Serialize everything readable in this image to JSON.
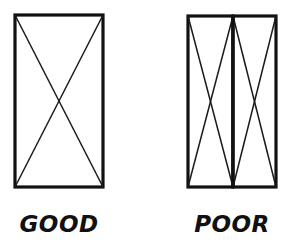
{
  "diagram": {
    "type": "technical-illustration",
    "background_color": "#ffffff",
    "line_color": "#111111",
    "figures": [
      {
        "id": "good",
        "caption": "GOOD",
        "caption_x": 59,
        "caption_y": 232,
        "description": "single wide panel with one full-width X brace",
        "panel_count": 1,
        "outline": {
          "x": 15,
          "y": 15,
          "width": 88,
          "height": 172
        },
        "panels": [
          {
            "x": 15,
            "y": 15,
            "width": 88,
            "height": 172,
            "center_x": 59,
            "center_y": 101
          }
        ],
        "braces": [
          {
            "x1": 15,
            "y1": 15,
            "x2": 103,
            "y2": 187
          },
          {
            "x1": 103,
            "y1": 15,
            "x2": 15,
            "y2": 187
          }
        ]
      },
      {
        "id": "poor",
        "caption": "POOR",
        "caption_x": 232,
        "caption_y": 232,
        "description": "same overall width split into two narrow panels, each with its own X brace",
        "panel_count": 2,
        "outline": {
          "x": 188,
          "y": 16,
          "width": 88,
          "height": 171
        },
        "divider": {
          "x": 233,
          "y1": 16,
          "y2": 187
        },
        "panels": [
          {
            "x": 188,
            "y": 16,
            "width": 45,
            "height": 171,
            "center_x": 210,
            "center_y": 101
          },
          {
            "x": 233,
            "y": 16,
            "width": 43,
            "height": 171,
            "center_x": 255,
            "center_y": 101
          }
        ],
        "braces": [
          {
            "x1": 188,
            "y1": 16,
            "x2": 233,
            "y2": 187
          },
          {
            "x1": 233,
            "y1": 16,
            "x2": 188,
            "y2": 187
          },
          {
            "x1": 233,
            "y1": 16,
            "x2": 276,
            "y2": 187
          },
          {
            "x1": 276,
            "y1": 16,
            "x2": 233,
            "y2": 187
          }
        ]
      }
    ]
  }
}
